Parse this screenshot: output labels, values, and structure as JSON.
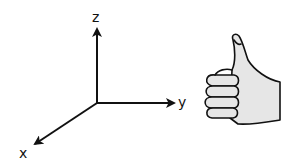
{
  "diagram": {
    "axes": {
      "x_label": "x",
      "y_label": "y",
      "z_label": "z"
    },
    "illustration": "thumbs-up-hand",
    "colors": {
      "stroke": "#111111",
      "hand_fill": "#e6e6e6",
      "background": "#ffffff"
    }
  }
}
